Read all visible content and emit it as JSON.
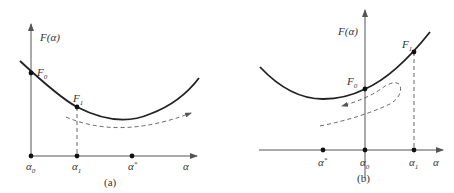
{
  "panel_a": {
    "caption": "(a)",
    "y_axis_label": "F(α)",
    "x_axis_label": "α",
    "points": [
      {
        "name": "F",
        "sub": "0"
      },
      {
        "name": "F",
        "sub": "1"
      }
    ],
    "x_ticks": [
      {
        "label": "α",
        "sub": "0"
      },
      {
        "label": "α",
        "sub": "1"
      },
      {
        "label": "α",
        "sup": "*"
      }
    ],
    "search_direction": "right"
  },
  "panel_b": {
    "caption": "(b)",
    "y_axis_label": "F(α)",
    "x_axis_label": "α",
    "points": [
      {
        "name": "F",
        "sub": "0"
      },
      {
        "name": "F",
        "sub": "1"
      }
    ],
    "x_ticks": [
      {
        "label": "α",
        "sup": "*"
      },
      {
        "label": "α",
        "sub": "0"
      },
      {
        "label": "α",
        "sub": "1"
      }
    ],
    "search_direction": "reverse-left"
  }
}
